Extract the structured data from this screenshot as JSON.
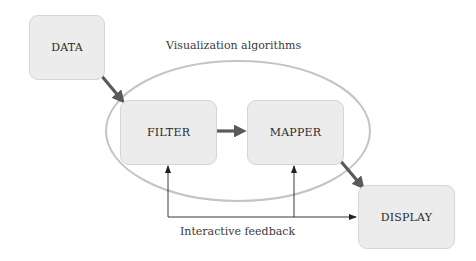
{
  "diagram": {
    "nodes": {
      "data": "DATA",
      "filter": "FILTER",
      "mapper": "MAPPER",
      "display": "DISPLAY"
    },
    "group_label": "Visualization algorithms",
    "feedback_label": "Interactive feedback",
    "edges": [
      {
        "from": "DATA",
        "to": "FILTER",
        "style": "thick"
      },
      {
        "from": "FILTER",
        "to": "MAPPER",
        "style": "thick"
      },
      {
        "from": "MAPPER",
        "to": "DISPLAY",
        "style": "thick"
      },
      {
        "from": "DISPLAY",
        "to": "FILTER",
        "style": "thin",
        "label": "Interactive feedback"
      },
      {
        "from": "DISPLAY",
        "to": "MAPPER",
        "style": "thin",
        "label": "Interactive feedback"
      }
    ],
    "colors": {
      "box_fill": "#ececec",
      "box_border": "#d6d6d6",
      "thick_arrow": "#5a5a5a",
      "thin_arrow": "#222222",
      "ellipse": "#c4c4c4"
    }
  }
}
